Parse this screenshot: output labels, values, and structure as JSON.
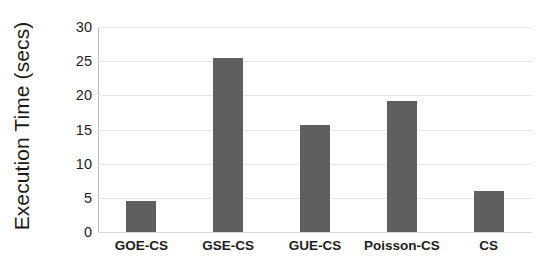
{
  "chart_data": {
    "type": "bar",
    "title": "",
    "xlabel": "",
    "ylabel": "Execution Time (secs)",
    "categories": [
      "GOE-CS",
      "GSE-CS",
      "GUE-CS",
      "Poisson-CS",
      "CS"
    ],
    "values": [
      4.6,
      25.4,
      15.7,
      19.2,
      6.0
    ],
    "ylim": [
      0,
      30
    ],
    "ytick_labels": [
      "30",
      "25",
      "20",
      "15",
      "10",
      "5",
      "0"
    ],
    "ytick_values": [
      30,
      25,
      20,
      15,
      10,
      5,
      0
    ],
    "grid": true,
    "legend": "none",
    "bar_color": "#5f5f5f",
    "gridline_color": "#e4e4e4",
    "axis_color": "#b8b8b8",
    "background_color": "#ffffff",
    "text_color": "#1c1c1c"
  }
}
